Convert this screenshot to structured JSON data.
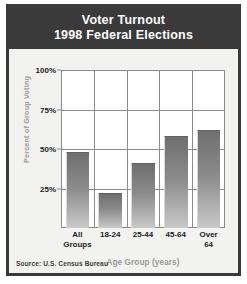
{
  "chart_data": {
    "type": "bar",
    "title": "Voter Turnout",
    "subtitle": "1998 Federal Elections",
    "categories": [
      "All Groups",
      "18-24",
      "25-44",
      "45-64",
      "Over 64"
    ],
    "category_lines": [
      [
        "All",
        "Groups"
      ],
      [
        "18-24",
        ""
      ],
      [
        "25-44",
        ""
      ],
      [
        "45-64",
        ""
      ],
      [
        "Over",
        "64"
      ]
    ],
    "values": [
      48,
      22,
      41,
      58,
      62
    ],
    "xlabel": "Age Group (years)",
    "ylabel": "Percent of Group Voting",
    "ylim": [
      0,
      100
    ],
    "yticks": [
      100,
      75,
      50,
      25
    ],
    "ytick_labels": [
      "100%",
      "75%",
      "50%",
      "25%"
    ],
    "grid": true,
    "legend": false,
    "source": "Source: U.S. Census Bureau",
    "colors": {
      "banner_background": "#3a3a3a",
      "banner_text": "#ffffff",
      "panel_background": "#f2f2f0",
      "plot_background": "#ffffff",
      "bar_top": "#6f6f6f",
      "bar_bottom": "#c9c9c9",
      "gridline": "#8c8c8c",
      "axis_title_text": "#9a9a9a",
      "tick_text": "#1d1d1d"
    }
  },
  "header": {
    "title_line_1": "Voter Turnout",
    "title_line_2": "1998 Federal Elections"
  },
  "footer": {
    "source": "Source: U.S. Census Bureau"
  }
}
